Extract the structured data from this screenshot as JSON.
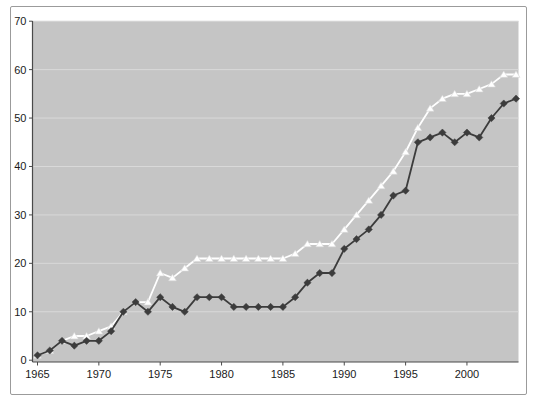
{
  "figure": {
    "kind": "line-chart-screenshot",
    "title": "",
    "background": "#ffffff",
    "frame_border_color": "#9b9b9b"
  },
  "colors": {
    "plot_background": "#c5c5c5",
    "gridline": "#d9d9d9",
    "axis": "#4a4a4a",
    "tick_text": "#1a1a1a",
    "series_dark": "#3c3c3c",
    "series_light": "#ffffff",
    "series_light_edge": "#d6d6d6"
  },
  "chart_data": {
    "type": "line",
    "title": "",
    "xlabel": "",
    "ylabel": "",
    "ylim": [
      0,
      70
    ],
    "yticks": [
      0,
      10,
      20,
      30,
      40,
      50,
      60,
      70
    ],
    "xticks": [
      1965,
      1970,
      1975,
      1980,
      1985,
      1990,
      1995,
      2000
    ],
    "grid": true,
    "legend": false,
    "x": [
      1965,
      1966,
      1967,
      1968,
      1969,
      1970,
      1971,
      1972,
      1973,
      1974,
      1975,
      1976,
      1977,
      1978,
      1979,
      1980,
      1981,
      1982,
      1983,
      1984,
      1985,
      1986,
      1987,
      1988,
      1989,
      1990,
      1991,
      1992,
      1993,
      1994,
      1995,
      1996,
      1997,
      1998,
      1999,
      2000,
      2001,
      2002,
      2003,
      2004
    ],
    "series": [
      {
        "name": "light-triangle-series",
        "marker": "triangle",
        "color": "#ffffff",
        "values": [
          1,
          2,
          4,
          5,
          5,
          6,
          7,
          10,
          12,
          12,
          18,
          17,
          19,
          21,
          21,
          21,
          21,
          21,
          21,
          21,
          21,
          22,
          24,
          24,
          24,
          27,
          30,
          33,
          36,
          39,
          43,
          48,
          52,
          54,
          55,
          55,
          56,
          57,
          59,
          59
        ]
      },
      {
        "name": "dark-diamond-series",
        "marker": "diamond",
        "color": "#3c3c3c",
        "values": [
          1,
          2,
          4,
          3,
          4,
          4,
          6,
          10,
          12,
          10,
          13,
          11,
          10,
          13,
          13,
          13,
          11,
          11,
          11,
          11,
          11,
          13,
          16,
          18,
          18,
          23,
          25,
          27,
          30,
          34,
          35,
          45,
          46,
          47,
          45,
          47,
          46,
          50,
          53,
          54
        ]
      }
    ]
  }
}
